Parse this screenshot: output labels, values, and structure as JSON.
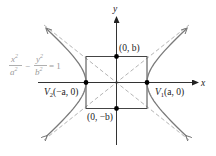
{
  "diagram": {
    "equation": {
      "x_num": "x",
      "x_num_exp": "2",
      "a_den": "a",
      "a_den_exp": "2",
      "minus": "−",
      "y_num": "y",
      "y_num_exp": "2",
      "b_den": "b",
      "b_den_exp": "2",
      "equals": "= 1"
    },
    "axes": {
      "x_label": "x",
      "y_label": "y"
    },
    "points": [
      {
        "name": "vertex-1",
        "label_prefix": "V",
        "label_sub": "1",
        "label_coords": "(a, 0)"
      },
      {
        "name": "vertex-2",
        "label_prefix": "V",
        "label_sub": "2",
        "label_coords": "(−a, 0)"
      },
      {
        "name": "co-vertex-top",
        "label_coords": "(0, b)"
      },
      {
        "name": "co-vertex-bottom",
        "label_coords": "(0, −b)"
      }
    ],
    "colors": {
      "axis": "#333333",
      "curve": "#7a7a7a",
      "asymptote": "#b0b0b0",
      "rectangle": "#444444",
      "point": "#000000",
      "equation_text": "#9a9a9a"
    }
  }
}
